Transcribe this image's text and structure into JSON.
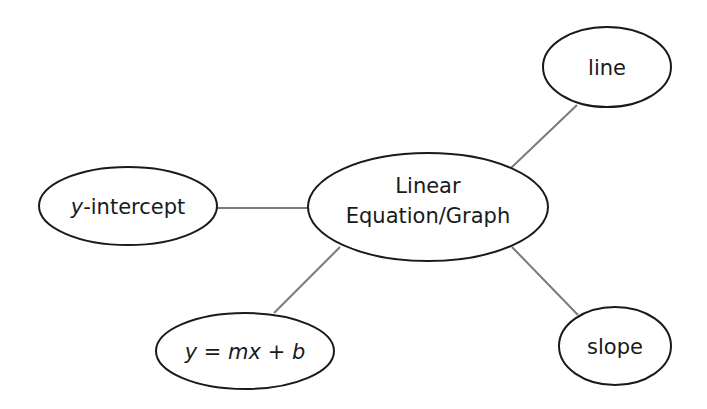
{
  "diagram": {
    "type": "concept-map",
    "center": {
      "id": "linear-equation-graph",
      "label_line1": "Linear",
      "label_line2": "Equation/Graph",
      "cx": 428,
      "cy": 207,
      "rx": 120,
      "ry": 54
    },
    "nodes": [
      {
        "id": "line",
        "label": "line",
        "cx": 607,
        "cy": 67,
        "rx": 64,
        "ry": 40
      },
      {
        "id": "y-intercept",
        "label_italic": "y",
        "label_rest": "-intercept",
        "cx": 128,
        "cy": 206,
        "rx": 89,
        "ry": 39
      },
      {
        "id": "slope-intercept-form",
        "label_y": "y",
        "label_eq": " = ",
        "label_mx": "mx",
        "label_plus": " + ",
        "label_b": "b",
        "cx": 245,
        "cy": 351,
        "rx": 89,
        "ry": 38
      },
      {
        "id": "slope",
        "label": "slope",
        "cx": 615,
        "cy": 346,
        "rx": 56,
        "ry": 39
      }
    ],
    "edges": [
      {
        "from": "linear-equation-graph",
        "to": "line"
      },
      {
        "from": "linear-equation-graph",
        "to": "y-intercept"
      },
      {
        "from": "linear-equation-graph",
        "to": "slope-intercept-form"
      },
      {
        "from": "linear-equation-graph",
        "to": "slope"
      }
    ],
    "colors": {
      "outline": "#1a1a1a",
      "edge": "#7a7a7a",
      "background": "#ffffff"
    }
  }
}
